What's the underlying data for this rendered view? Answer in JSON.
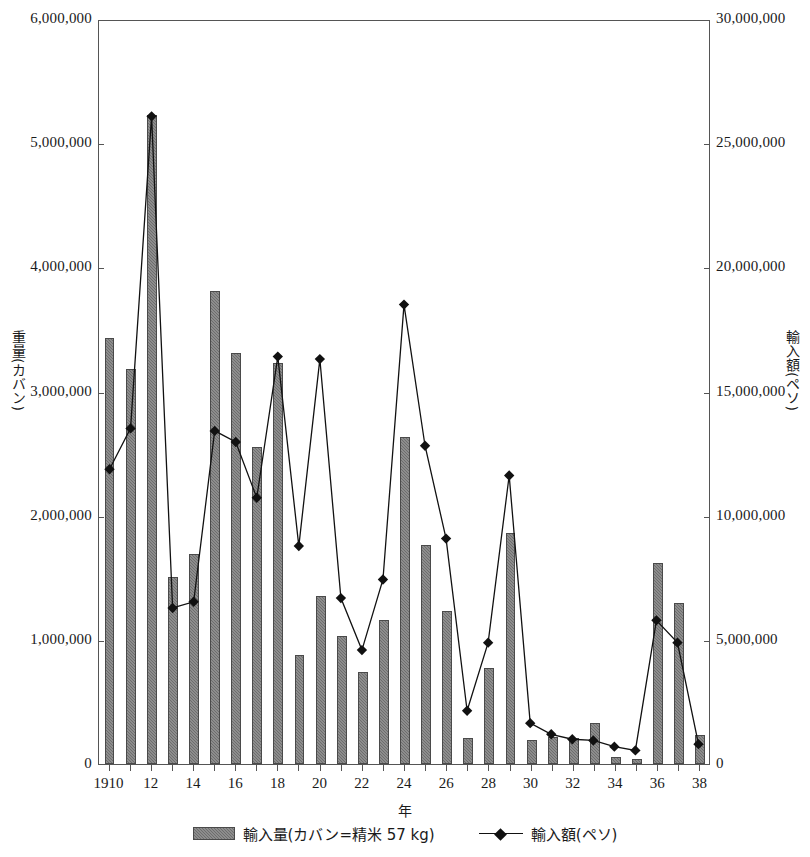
{
  "chart_data": {
    "type": "bar",
    "title": "",
    "xlabel": "年",
    "ylabel": "重量(カバン)",
    "ylabel_right": "輸入額(ペソ)",
    "ylim": [
      0,
      6000000
    ],
    "ylim_right": [
      0,
      30000000
    ],
    "grid": false,
    "legend_position": "bottom",
    "categories": [
      "1910",
      "11",
      "12",
      "13",
      "14",
      "15",
      "16",
      "17",
      "18",
      "19",
      "20",
      "21",
      "22",
      "23",
      "24",
      "25",
      "26",
      "27",
      "28",
      "29",
      "30",
      "31",
      "32",
      "33",
      "34",
      "35",
      "36",
      "37",
      "38"
    ],
    "xtick_labels": [
      "1910",
      "12",
      "14",
      "16",
      "18",
      "20",
      "22",
      "24",
      "26",
      "28",
      "30",
      "32",
      "34",
      "36",
      "38"
    ],
    "ytick_labels_left": [
      "0",
      "1,000,000",
      "2,000,000",
      "3,000,000",
      "4,000,000",
      "5,000,000",
      "6,000,000"
    ],
    "ytick_labels_right": [
      "0",
      "5,000,000",
      "10,000,000",
      "15,000,000",
      "20,000,000",
      "25,000,000",
      "30,000,000"
    ],
    "series": [
      {
        "name": "輸入量(カバン=精米 57 kg)",
        "type": "bar",
        "axis": "left",
        "color": "#6d6d6d",
        "values": [
          3430000,
          3180000,
          5230000,
          1510000,
          1690000,
          3810000,
          3310000,
          2550000,
          3230000,
          880000,
          1350000,
          1030000,
          740000,
          1160000,
          2630000,
          1760000,
          1230000,
          210000,
          770000,
          1860000,
          190000,
          220000,
          210000,
          330000,
          60000,
          40000,
          1620000,
          1300000,
          230000
        ]
      },
      {
        "name": "輸入額(ペソ)",
        "type": "line",
        "axis": "right",
        "color": "#111111",
        "marker": "diamond",
        "values": [
          11900000,
          13550000,
          26150000,
          6300000,
          6550000,
          13450000,
          13000000,
          10750000,
          16450000,
          8800000,
          16350000,
          6700000,
          4600000,
          7450000,
          18550000,
          12850000,
          9100000,
          2150000,
          4900000,
          11650000,
          1650000,
          1200000,
          1000000,
          950000,
          700000,
          550000,
          5800000,
          4900000,
          800000
        ]
      }
    ]
  },
  "legend": {
    "bar_label": "輸入量(カバン=精米 57 kg)",
    "line_label": "輸入額(ペソ)"
  }
}
